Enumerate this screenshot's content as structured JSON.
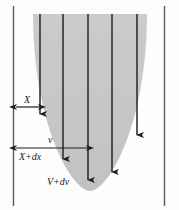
{
  "figure": {
    "type": "diagram",
    "colors": {
      "shade_fill": "#c9c9c9",
      "line": "#2b2b2b",
      "border": "#555555",
      "background": "#fdfdfd"
    },
    "labels": {
      "x": "X",
      "v": "v",
      "x_plus_dx": "X+dx",
      "v_plus_dv": "V+dv"
    },
    "geometry": {
      "left_border_x": 13,
      "right_border_x": 164,
      "vertical_lines_x": [
        40,
        63,
        88,
        112,
        137
      ],
      "parabola_bottom_y": 191,
      "top_y": 14
    },
    "dimension_arrows": [
      {
        "name": "x-dimension",
        "y": 107,
        "x_start": 15,
        "x_end": 40
      },
      {
        "name": "x-plus-dx-dimension",
        "y": 148,
        "x_start": 15,
        "x_end": 88
      }
    ],
    "flow_arrows": [
      {
        "name": "flow-arrow-1",
        "x": 40,
        "y_end": 120
      },
      {
        "name": "flow-arrow-2",
        "x": 63,
        "y_end": 165
      },
      {
        "name": "flow-arrow-3",
        "x": 88,
        "y_end": 186
      },
      {
        "name": "flow-arrow-4",
        "x": 112,
        "y_end": 178
      },
      {
        "name": "flow-arrow-5",
        "x": 137,
        "y_end": 141
      }
    ]
  }
}
